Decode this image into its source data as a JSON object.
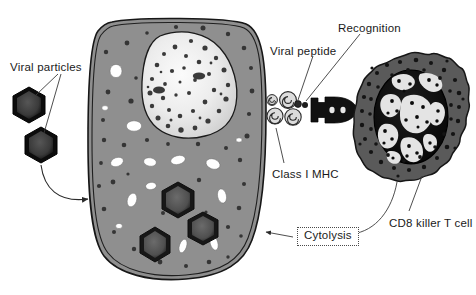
{
  "figure": {
    "width": 476,
    "height": 295,
    "background": "#ffffff"
  },
  "colors": {
    "cell_cytoplasm": "#8f8f8f",
    "cell_membrane_stroke": "#1a1a1a",
    "nucleus_light": "#f2f2f2",
    "nucleus_mid": "#d8d8d8",
    "granule_dark": "#3a3a3a",
    "vacuole_white": "#ffffff",
    "virus_outer": "#0d0d0d",
    "virus_inner": "#4a4a4a",
    "tcell_cytoplasm": "#5a5a5a",
    "tcell_nucleus": "#111111",
    "tcell_chromatin": "#e8e8e8",
    "receptor_dark": "#111111",
    "mhc_stroke": "#2a2a2a",
    "label_text": "#1a1a1a",
    "leader_line": "#3a3a3a"
  },
  "labels": {
    "viral_particles": "Viral particles",
    "viral_peptide": "Viral peptide",
    "recognition": "Recognition",
    "class_i_mhc": "Class I MHC",
    "cytolysis": "Cytolysis",
    "cd8_killer_t_cell": "CD8 killer T cell"
  },
  "elements": {
    "infected_cell": {
      "name": "virus-infected cell",
      "membrane": "double-line",
      "nucleus": "large irregular pale nucleus with dark chromatin granules",
      "vacuoles": 14,
      "cytoplasmic_granules": 38,
      "intracellular_virions": 3
    },
    "viral_particles": {
      "count": 2,
      "shape": "hexagon",
      "positions": [
        "upper-left",
        "lower-left"
      ]
    },
    "mhc_complexes": {
      "count": 4,
      "shape": "spiral-swirl",
      "description": "Class I MHC molecules on infected cell surface presenting viral peptide"
    },
    "viral_peptide": {
      "count": 1,
      "shape": "small dark dot sitting in MHC groove"
    },
    "t_cell": {
      "name": "CD8 killer T cell",
      "membrane": "ruffled / scalloped",
      "nucleus": "dark oval nucleus with light mottled chromatin",
      "granules": 46,
      "receptor": "T-cell receptor, dark fork/Y shape"
    },
    "cytolysis_box": {
      "border": "dotted",
      "arrow_to": "infected cell membrane"
    }
  },
  "label_positions": {
    "viral_particles": {
      "x": 10,
      "y": 62
    },
    "viral_peptide": {
      "x": 270,
      "y": 46
    },
    "recognition": {
      "x": 338,
      "y": 23
    },
    "class_i_mhc": {
      "x": 272,
      "y": 169
    },
    "cytolysis": {
      "x": 297,
      "y": 231
    },
    "cd8_killer_t_cell": {
      "x": 389,
      "y": 218
    }
  }
}
